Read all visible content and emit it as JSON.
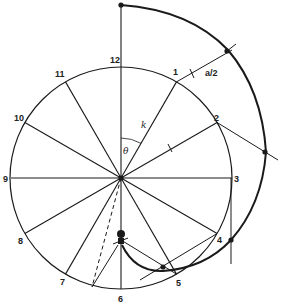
{
  "diagram": {
    "circle": {
      "cx": 121,
      "cy": 178,
      "r": 111
    },
    "hour_labels": [
      "12",
      "1",
      "2",
      "3",
      "4",
      "5",
      "6",
      "7",
      "8",
      "9",
      "10",
      "11"
    ],
    "symbols": {
      "radius": "k",
      "angle": "θ",
      "half_a": "a/2"
    },
    "colors": {
      "ink": "#1a1a1a",
      "background": "#ffffff"
    }
  }
}
